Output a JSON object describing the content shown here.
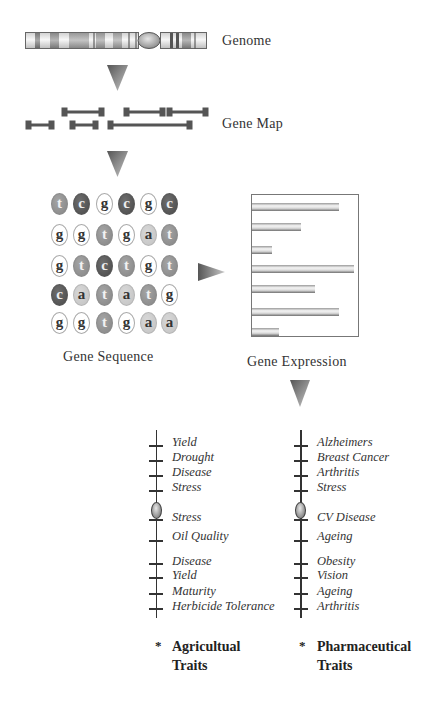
{
  "labels": {
    "genome": "Genome",
    "gene_map": "Gene Map",
    "gene_sequence": "Gene Sequence",
    "gene_expression": "Gene Expression"
  },
  "sequence": {
    "rows": [
      [
        "t",
        "c",
        "g",
        "c",
        "g",
        "c"
      ],
      [
        "g",
        "g",
        "t",
        "g",
        "a",
        "t"
      ],
      [
        "g",
        "t",
        "c",
        "t",
        "g",
        "t"
      ],
      [
        "c",
        "a",
        "t",
        "a",
        "t",
        "g"
      ],
      [
        "g",
        "g",
        "t",
        "g",
        "a",
        "a"
      ]
    ]
  },
  "colors": {
    "t": "#8c8c8c",
    "c": "#555555",
    "g": "#ffffff",
    "a": "#c8c8c8",
    "line": "#333333"
  },
  "gene_map": {
    "segments": [
      {
        "x1": 64,
        "x2": 102,
        "y": 112
      },
      {
        "x1": 126,
        "x2": 163,
        "y": 112
      },
      {
        "x1": 169,
        "x2": 206,
        "y": 112
      },
      {
        "x1": 28,
        "x2": 52,
        "y": 125
      },
      {
        "x1": 72,
        "x2": 96,
        "y": 125
      },
      {
        "x1": 110,
        "x2": 190,
        "y": 125
      }
    ]
  },
  "expression": {
    "bars_relative": [
      87,
      49,
      20,
      102,
      63,
      87,
      27
    ]
  },
  "agricultural": {
    "traits": [
      "Yield",
      "Drought",
      "Disease",
      "Stress",
      "Stress",
      "Oil Quality",
      "Disease",
      "Yield",
      "Maturity",
      "Herbicide Tolerance"
    ],
    "footer_star": "*",
    "footer_line1": "Agricultual",
    "footer_line2": "Traits"
  },
  "pharmaceutical": {
    "traits": [
      "Alzheimers",
      "Breast Cancer",
      "Arthritis",
      "Stress",
      "CV Disease",
      "Ageing",
      "Obesity",
      "Vision",
      "Ageing",
      "Arthritis"
    ],
    "footer_star": "*",
    "footer_line1": "Pharmaceutical",
    "footer_line2": "Traits"
  }
}
